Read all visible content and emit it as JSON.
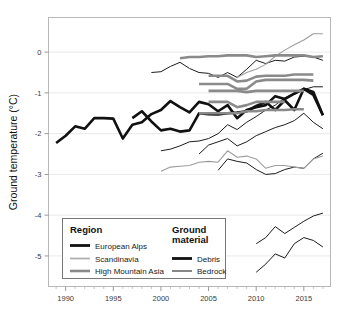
{
  "chart_data": {
    "type": "line",
    "title": "",
    "xlabel": "",
    "ylabel": "Ground temperature (°C)",
    "xlim": [
      1988.2,
      2017.8
    ],
    "ylim": [
      -5.75,
      0.85
    ],
    "xticks": [
      1990,
      1995,
      2000,
      2005,
      2010,
      2015
    ],
    "xticklabels": [
      "1990",
      "1995",
      "2000",
      "2005",
      "2010",
      "2015"
    ],
    "yticks": [
      0,
      -1,
      -2,
      -3,
      -4,
      -5
    ],
    "yticklabels": [
      "0",
      "-1",
      "-2",
      "-3",
      "-4",
      "-5"
    ],
    "xminorticks": [
      1989,
      1991,
      1992,
      1993,
      1994,
      1996,
      1997,
      1998,
      1999,
      2001,
      2002,
      2003,
      2004,
      2006,
      2007,
      2008,
      2009,
      2011,
      2012,
      2013,
      2014,
      2016,
      2017
    ],
    "grid": "horizontal-major-only",
    "grid_color": "#e9e9e9",
    "frame": true,
    "frame_color": "#b8b8b8",
    "legend_position": "lower-left-inside",
    "series": [
      {
        "name": "Alps debris A",
        "region": "European Alps",
        "material": "Debris",
        "color": "#111111",
        "width": 2.6,
        "x": [
          1989,
          1990,
          1991,
          1992,
          1993,
          1994,
          1995,
          1996,
          1997,
          1998,
          1999,
          2000,
          2001,
          2002,
          2003,
          2004,
          2005,
          2006,
          2007,
          2008,
          2009,
          2010,
          2011,
          2012,
          2013,
          2014,
          2015,
          2016,
          2017
        ],
        "y": [
          -2.23,
          -2.05,
          -1.82,
          -1.88,
          -1.62,
          -1.62,
          -1.63,
          -2.12,
          -1.78,
          -1.72,
          -1.52,
          -1.42,
          -1.2,
          -1.35,
          -1.48,
          -1.22,
          -1.28,
          -1.45,
          -1.3,
          -1.62,
          -1.42,
          -1.35,
          -1.3,
          -1.08,
          -1.15,
          -1.02,
          -0.9,
          -1.05,
          -1.55
        ]
      },
      {
        "name": "Alps debris B",
        "region": "European Alps",
        "material": "Debris",
        "color": "#111111",
        "width": 2.6,
        "x": [
          1997,
          1998,
          1999,
          2000,
          2001,
          2002,
          2003,
          2004,
          2005,
          2006,
          2007,
          2008,
          2009,
          2010,
          2011,
          2012,
          2013,
          2014,
          2015,
          2016,
          2017
        ],
        "y": [
          -1.62,
          -1.45,
          -1.7,
          -1.92,
          -1.88,
          -1.95,
          -1.92,
          -1.5,
          -1.52,
          -1.53,
          -1.5,
          -1.48,
          -1.45,
          -1.32,
          -1.22,
          -1.42,
          -1.18,
          -1.42,
          -0.9,
          -0.98,
          -1.55
        ]
      },
      {
        "name": "Alps bedrock C",
        "region": "European Alps",
        "material": "Bedrock",
        "color": "#1c1c1c",
        "width": 1.0,
        "x": [
          1999,
          2000,
          2001,
          2002,
          2003,
          2004,
          2005,
          2006,
          2007,
          2008,
          2009,
          2010,
          2011,
          2012,
          2013,
          2014,
          2015,
          2016,
          2017
        ],
        "y": [
          -0.5,
          -0.48,
          -0.35,
          -0.25,
          -0.4,
          -0.5,
          -0.52,
          -0.62,
          -0.5,
          -0.62,
          -0.42,
          -0.2,
          -0.28,
          -0.2,
          -0.22,
          -0.12,
          -0.1,
          -0.12,
          -0.2
        ]
      },
      {
        "name": "Alps bedrock D",
        "region": "European Alps",
        "material": "Bedrock",
        "color": "#1c1c1c",
        "width": 1.0,
        "x": [
          2004,
          2005,
          2006,
          2007,
          2008,
          2009,
          2010,
          2011,
          2012,
          2013,
          2014,
          2015,
          2016,
          2017
        ],
        "y": [
          -2.5,
          -2.28,
          -2.2,
          -2.12,
          -2.3,
          -2.2,
          -2.05,
          -1.95,
          -1.85,
          -1.78,
          -1.68,
          -1.5,
          -1.72,
          -1.88
        ]
      },
      {
        "name": "Alps bedrock E",
        "region": "European Alps",
        "material": "Bedrock",
        "color": "#1c1c1c",
        "width": 1.0,
        "x": [
          2000,
          2001,
          2002,
          2003,
          2004,
          2005,
          2006,
          2007,
          2008,
          2009,
          2010,
          2011,
          2012,
          2013,
          2014,
          2015,
          2016,
          2017
        ],
        "y": [
          -2.42,
          -2.38,
          -2.3,
          -2.2,
          -2.18,
          -2.12,
          -2.0,
          -1.78,
          -1.9,
          -1.72,
          -1.58,
          -1.42,
          -1.3,
          -1.12,
          -1.0,
          -0.92,
          -0.85,
          -0.85
        ]
      },
      {
        "name": "Alps bedrock F",
        "region": "European Alps",
        "material": "Bedrock",
        "color": "#1c1c1c",
        "width": 1.0,
        "x": [
          2006,
          2007,
          2008,
          2009,
          2010,
          2011,
          2012,
          2013,
          2014,
          2015,
          2016,
          2017
        ],
        "y": [
          -2.9,
          -2.62,
          -2.68,
          -2.72,
          -2.88,
          -3.0,
          -2.98,
          -2.88,
          -2.82,
          -2.85,
          -2.62,
          -2.48
        ]
      },
      {
        "name": "Alps bedrock G",
        "region": "European Alps",
        "material": "Bedrock",
        "color": "#1c1c1c",
        "width": 1.0,
        "x": [
          2010,
          2011,
          2012,
          2013,
          2014,
          2015,
          2016,
          2017
        ],
        "y": [
          -4.7,
          -4.55,
          -4.28,
          -4.45,
          -4.3,
          -4.15,
          -4.02,
          -3.95
        ]
      },
      {
        "name": "Alps bedrock H",
        "region": "European Alps",
        "material": "Bedrock",
        "color": "#1c1c1c",
        "width": 1.0,
        "x": [
          2010,
          2011,
          2012,
          2013,
          2014,
          2015,
          2016,
          2017
        ],
        "y": [
          -5.4,
          -5.2,
          -4.95,
          -5.05,
          -4.7,
          -4.55,
          -4.62,
          -4.78
        ]
      },
      {
        "name": "Scandinavia bedrock A",
        "region": "Scandinavia",
        "material": "Bedrock",
        "color": "#9d9d9d",
        "width": 1.1,
        "x": [
          2008,
          2009,
          2010,
          2011,
          2012,
          2013,
          2014,
          2015,
          2016,
          2017
        ],
        "y": [
          -0.62,
          -0.5,
          -0.42,
          -0.3,
          -0.1,
          0.05,
          0.18,
          0.3,
          0.45,
          0.45
        ]
      },
      {
        "name": "Scandinavia bedrock B",
        "region": "Scandinavia",
        "material": "Bedrock",
        "color": "#9d9d9d",
        "width": 1.1,
        "x": [
          2000,
          2001,
          2002,
          2003,
          2004,
          2005,
          2006,
          2007,
          2008,
          2009,
          2010,
          2011,
          2012,
          2013,
          2014,
          2015,
          2016,
          2017
        ],
        "y": [
          -2.92,
          -2.82,
          -2.8,
          -2.78,
          -2.7,
          -2.68,
          -2.7,
          -2.42,
          -2.58,
          -2.55,
          -2.62,
          -2.85,
          -2.78,
          -2.78,
          -2.82,
          -2.85,
          -2.62,
          -2.55
        ]
      },
      {
        "name": "HMA debris A",
        "region": "High Mountain Asia",
        "material": "Debris",
        "color": "#8a8a8a",
        "width": 2.6,
        "x": [
          2002,
          2003,
          2004,
          2005,
          2006,
          2007,
          2008,
          2009,
          2010,
          2011,
          2012,
          2013,
          2014,
          2015,
          2016,
          2017
        ],
        "y": [
          -0.15,
          -0.12,
          -0.12,
          -0.1,
          -0.1,
          -0.08,
          -0.08,
          -0.08,
          -0.12,
          -0.1,
          -0.08,
          -0.08,
          -0.08,
          -0.08,
          -0.12,
          -0.1
        ]
      },
      {
        "name": "HMA debris B",
        "region": "High Mountain Asia",
        "material": "Debris",
        "color": "#8a8a8a",
        "width": 2.6,
        "x": [
          2005,
          2006,
          2007,
          2008,
          2009,
          2010,
          2011,
          2012,
          2013,
          2014,
          2015,
          2016
        ],
        "y": [
          -0.58,
          -0.58,
          -0.58,
          -0.72,
          -0.7,
          -0.6,
          -0.58,
          -0.58,
          -0.58,
          -0.55,
          -0.55,
          -0.55
        ]
      },
      {
        "name": "HMA debris C",
        "region": "High Mountain Asia",
        "material": "Debris",
        "color": "#8a8a8a",
        "width": 2.6,
        "x": [
          2004,
          2005,
          2006,
          2007,
          2008,
          2009,
          2010,
          2011,
          2012,
          2013,
          2014,
          2015,
          2016
        ],
        "y": [
          -0.78,
          -0.78,
          -0.78,
          -0.78,
          -0.9,
          -0.9,
          -0.72,
          -0.68,
          -0.68,
          -0.68,
          -0.68,
          -0.68,
          -0.7
        ]
      },
      {
        "name": "HMA debris D",
        "region": "High Mountain Asia",
        "material": "Debris",
        "color": "#8a8a8a",
        "width": 2.6,
        "x": [
          2005,
          2006,
          2007,
          2008,
          2009,
          2010,
          2011,
          2012,
          2013,
          2014,
          2015
        ],
        "y": [
          -0.95,
          -0.95,
          -0.95,
          -0.95,
          -0.98,
          -0.95,
          -0.95,
          -0.95,
          -0.95,
          -0.95,
          -0.95
        ]
      },
      {
        "name": "HMA debris E",
        "region": "High Mountain Asia",
        "material": "Debris",
        "color": "#8a8a8a",
        "width": 2.6,
        "x": [
          2005,
          2006,
          2007,
          2008,
          2009,
          2010,
          2011,
          2012,
          2013
        ],
        "y": [
          -1.22,
          -1.22,
          -1.22,
          -1.35,
          -1.3,
          -1.22,
          -1.22,
          -1.22,
          -1.22
        ]
      },
      {
        "name": "HMA debris F",
        "region": "High Mountain Asia",
        "material": "Debris",
        "color": "#8a8a8a",
        "width": 2.6,
        "x": [
          2004,
          2005,
          2006,
          2007,
          2008,
          2009,
          2010,
          2011,
          2012,
          2013,
          2014,
          2015
        ],
        "y": [
          -1.5,
          -1.5,
          -1.5,
          -1.5,
          -1.5,
          -1.45,
          -1.45,
          -1.42,
          -1.42,
          -1.42,
          -1.4,
          -1.4
        ]
      }
    ]
  },
  "legend": {
    "box": {
      "border_color": "#777777",
      "fill": "#ffffff"
    },
    "group_region": {
      "title": "Region",
      "items": [
        {
          "label": "European Alps",
          "color": "#111111",
          "width": 2.8
        },
        {
          "label": "Scandinavia",
          "color": "#b0b0b0",
          "width": 1.8
        },
        {
          "label": "High Mountain Asia",
          "color": "#8a8a8a",
          "width": 2.6
        }
      ]
    },
    "group_material": {
      "title_line1": "Ground",
      "title_line2": "material",
      "items": [
        {
          "label": "Debris",
          "color": "#111111",
          "width": 2.8
        },
        {
          "label": "Bedrock",
          "color": "#111111",
          "width": 1.0
        }
      ]
    }
  }
}
